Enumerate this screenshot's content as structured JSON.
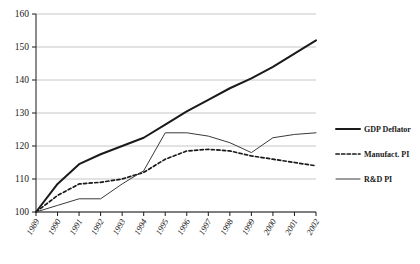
{
  "chart_data": {
    "type": "line",
    "title": "",
    "xlabel": "",
    "ylabel": "",
    "ylim": [
      100,
      160
    ],
    "yticks": [
      100,
      110,
      120,
      130,
      140,
      150,
      160
    ],
    "grid": true,
    "legend_position": "right",
    "categories": [
      "1989",
      "1990",
      "1991",
      "1992",
      "1993",
      "1994",
      "1995",
      "1996",
      "1997",
      "1998",
      "1999",
      "2000",
      "2001",
      "2002"
    ],
    "series": [
      {
        "name": "GDP Deflator",
        "style": "solid-thick",
        "color": "#1a1a1a",
        "values": [
          100.0,
          108.5,
          114.5,
          117.5,
          120.0,
          122.5,
          126.5,
          130.5,
          134.0,
          137.5,
          140.5,
          144.0,
          148.0,
          152.0
        ]
      },
      {
        "name": "Manufact. PI",
        "style": "dashed",
        "color": "#1a1a1a",
        "values": [
          100.0,
          105.0,
          108.5,
          109.0,
          110.0,
          112.0,
          116.0,
          118.5,
          119.0,
          118.5,
          117.0,
          116.0,
          115.0,
          114.0
        ]
      },
      {
        "name": "R&D PI",
        "style": "solid-thin",
        "color": "#3a3a3a",
        "values": [
          100.0,
          102.0,
          104.0,
          104.0,
          108.5,
          112.5,
          124.0,
          124.0,
          123.0,
          121.0,
          118.0,
          122.5,
          123.5,
          124.0
        ]
      }
    ]
  },
  "legend": {
    "items": [
      {
        "label": "GDP Deflator",
        "swatch": "solid-thick"
      },
      {
        "label": "Manufact. PI",
        "swatch": "dashed"
      },
      {
        "label": "R&D PI",
        "swatch": "solid-thin"
      }
    ]
  },
  "colors": {
    "axis": "#1a1a1a",
    "grid": "#b8b8b8",
    "series_dark": "#1a1a1a",
    "series_gray": "#3a3a3a",
    "background": "#ffffff"
  }
}
